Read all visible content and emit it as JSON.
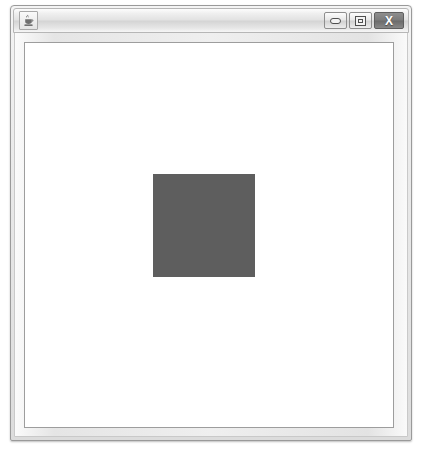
{
  "window": {
    "title": "",
    "app_icon": "java-coffee-cup-icon",
    "controls": {
      "minimize_label": "",
      "minimize_icon": "minimize-icon",
      "maximize_label": "",
      "maximize_icon": "maximize-icon",
      "close_label": "X",
      "close_icon": "close-icon"
    },
    "frame_color": "#e5e5e5",
    "titlebar_color": "#e2e2e2",
    "close_button_color": "#7b7b7b"
  },
  "canvas": {
    "background_color": "#ffffff",
    "shapes": [
      {
        "name": "filled-square",
        "type": "rectangle",
        "x": 128,
        "y": 131,
        "width": 102,
        "height": 103,
        "fill": "#5e5e5e"
      }
    ]
  },
  "page": {
    "background_color": "#ffffff"
  }
}
